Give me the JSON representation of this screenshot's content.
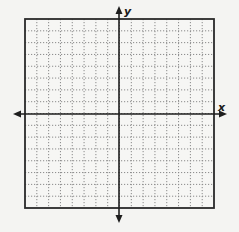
{
  "diagram": {
    "type": "coordinate-plane",
    "grid": {
      "columns": 16,
      "rows": 16,
      "line_style": "dotted",
      "line_color": "#8a8a8a",
      "border_color": "#2a2a2a",
      "background": "#f6f6f4"
    },
    "axes": {
      "x_label": "x",
      "y_label": "y",
      "arrows": "both-ends",
      "axis_color": "#1e1e1e"
    },
    "box": {
      "left": 25,
      "top": 19,
      "right": 214,
      "bottom": 208
    },
    "x_axis": {
      "y": 114,
      "from": 13,
      "to": 227
    },
    "y_axis": {
      "x": 119,
      "from": 6,
      "to": 223
    }
  }
}
